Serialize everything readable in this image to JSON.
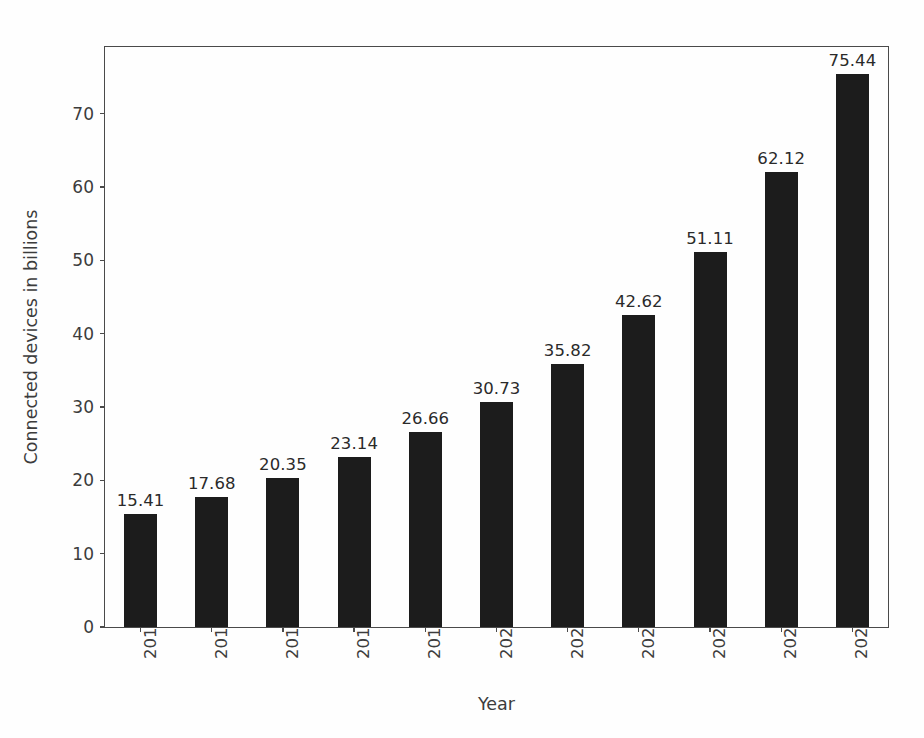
{
  "chart_data": {
    "type": "bar",
    "title": "",
    "xlabel": "Year",
    "ylabel": "Connected devices in billions",
    "categories": [
      "2015",
      "2016",
      "2017",
      "2018",
      "2019",
      "2020",
      "2021",
      "2022",
      "2023",
      "2024",
      "2025"
    ],
    "values": [
      15.41,
      17.68,
      20.35,
      23.14,
      26.66,
      30.73,
      35.82,
      42.62,
      51.11,
      62.12,
      75.44
    ],
    "value_labels": [
      "15.41",
      "17.68",
      "20.35",
      "23.14",
      "26.66",
      "30.73",
      "35.82",
      "42.62",
      "51.11",
      "62.12",
      "75.44"
    ],
    "yticks": [
      0,
      10,
      20,
      30,
      40,
      50,
      60,
      70
    ],
    "ytick_labels": [
      "0",
      "10",
      "20",
      "30",
      "40",
      "50",
      "60",
      "70"
    ],
    "ylim": [
      0,
      79.1
    ],
    "xlim": [
      -0.5,
      10.5
    ],
    "grid": false,
    "legend": null,
    "bar_color": "#1c1c1c",
    "axis_color": "#4a4a4a",
    "text_color": "#3c3c3c",
    "background_color": "#ffffff",
    "xtick_rotation": 90
  }
}
